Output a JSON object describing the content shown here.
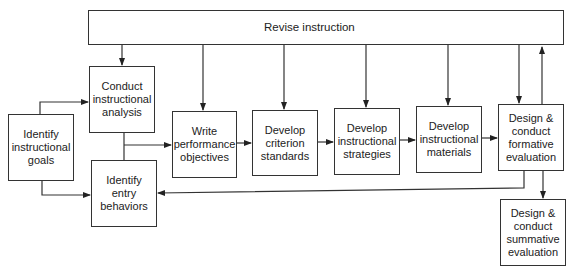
{
  "diagram": {
    "type": "flowchart",
    "title": "",
    "nodes": [
      {
        "id": "revise",
        "label": "Revise instruction"
      },
      {
        "id": "goals",
        "label": "Identify\ninstructional\ngoals"
      },
      {
        "id": "analysis",
        "label": "Conduct\ninstructional\nanalysis"
      },
      {
        "id": "entry",
        "label": "Identify\nentry\nbehaviors"
      },
      {
        "id": "objectives",
        "label": "Write\nperformance\nobjectives"
      },
      {
        "id": "criterion",
        "label": "Develop\ncriterion\nstandards"
      },
      {
        "id": "strategies",
        "label": "Develop\ninstructional\nstrategies"
      },
      {
        "id": "materials",
        "label": "Develop\ninstructional\nmaterials"
      },
      {
        "id": "formative",
        "label": "Design &\nconduct\nformative\nevaluation"
      },
      {
        "id": "summative",
        "label": "Design &\nconduct\nsummative\nevaluation"
      }
    ],
    "edges": [
      {
        "from": "goals",
        "to": "analysis"
      },
      {
        "from": "goals",
        "to": "entry"
      },
      {
        "from": "analysis",
        "to": "objectives"
      },
      {
        "from": "entry",
        "to": "objectives"
      },
      {
        "from": "objectives",
        "to": "criterion"
      },
      {
        "from": "criterion",
        "to": "strategies"
      },
      {
        "from": "strategies",
        "to": "materials"
      },
      {
        "from": "materials",
        "to": "formative"
      },
      {
        "from": "formative",
        "to": "summative"
      },
      {
        "from": "formative",
        "to": "revise"
      },
      {
        "from": "formative",
        "to": "entry"
      },
      {
        "from": "revise",
        "to": "analysis"
      },
      {
        "from": "revise",
        "to": "objectives"
      },
      {
        "from": "revise",
        "to": "criterion"
      },
      {
        "from": "revise",
        "to": "strategies"
      },
      {
        "from": "revise",
        "to": "materials"
      },
      {
        "from": "revise",
        "to": "formative"
      }
    ]
  }
}
